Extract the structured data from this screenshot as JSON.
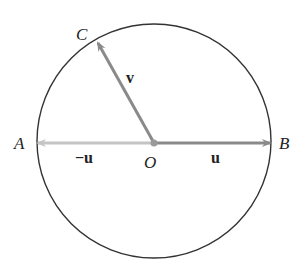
{
  "diagram": {
    "points": {
      "A": "A",
      "B": "B",
      "C": "C",
      "O": "O"
    },
    "vectors": {
      "u": "u",
      "neg_u": "−u",
      "v": "v"
    },
    "colors": {
      "circle": "#333333",
      "u": "#8a8a8a",
      "neg_u": "#c4c4c4",
      "v": "#8a8a8a",
      "origin": "#9a9a9a"
    }
  }
}
